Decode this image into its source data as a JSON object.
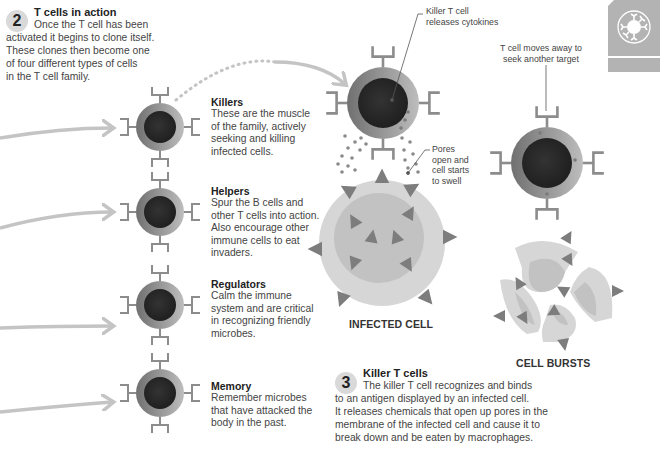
{
  "section2": {
    "number": "2",
    "title": "T cells in action",
    "lines": [
      "Once the T cell has been",
      "activated it begins to clone itself.",
      "These clones then become one",
      "of four different types of cells",
      "in the T cell family."
    ]
  },
  "cell_types": [
    {
      "name": "Killers",
      "lines": [
        "These are the muscle",
        "of the family, actively",
        "seeking and killing",
        "infected cells."
      ]
    },
    {
      "name": "Helpers",
      "lines": [
        "Spur the B cells and",
        "other T cells into action.",
        "Also encourage other",
        "immune cells to eat",
        "invaders."
      ]
    },
    {
      "name": "Regulators",
      "lines": [
        "Calm the immune",
        "system and are critical",
        "in recognizing friendly",
        "microbes."
      ]
    },
    {
      "name": "Memory",
      "lines": [
        "Remember microbes",
        "that have attacked the",
        "body in the past."
      ]
    }
  ],
  "callouts": {
    "cytokines": [
      "Killer T cell",
      "releases cytokines"
    ],
    "pores": [
      "Pores",
      "open and",
      "cell starts",
      "to swell"
    ],
    "moves_away": [
      "T cell moves away to",
      "seek another target"
    ]
  },
  "labels": {
    "infected_cell": "INFECTED CELL",
    "cell_bursts": "CELL BURSTS"
  },
  "section3": {
    "number": "3",
    "title": "Killer T cells",
    "lines": [
      "The killer T cell recognizes and binds",
      "to an antigen displayed by an infected cell.",
      "It releases chemicals that open up pores in the",
      "membrane of the infected cell and cause it to",
      "break down and be eaten by macrophages."
    ]
  },
  "colors": {
    "cell_outer_dark": "#7a7a7a",
    "cell_outer_light": "#b8b8b8",
    "cell_nucleus": "#2a2a2a",
    "receptor": "#8c8c8c",
    "arrow": "#c4c4c4",
    "infected_outer": "#d6d6d6",
    "infected_inner": "#c2c2c2",
    "antigen": "#7d7d7d",
    "badge": "#d9d9d9",
    "tab": "#b3b3b3"
  },
  "icons": {
    "corner_tab": "immune-cell-icon"
  }
}
